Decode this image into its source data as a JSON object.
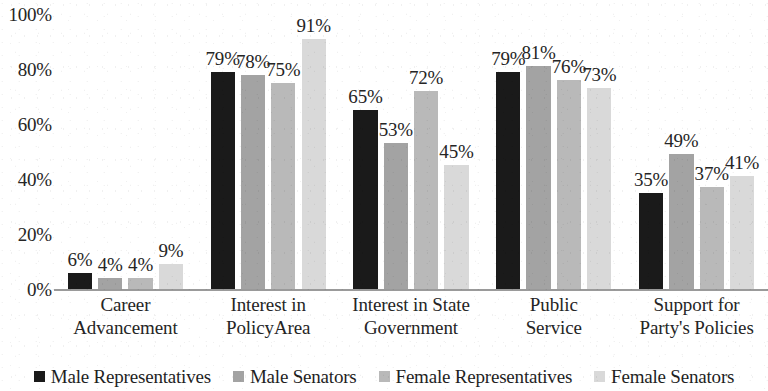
{
  "chart_data": {
    "type": "bar",
    "title": "",
    "subtitle": "",
    "xlabel": "",
    "ylabel": "",
    "ylim": [
      0,
      100
    ],
    "grid": false,
    "legend_position": "bottom",
    "y_ticks": [
      "0%",
      "20%",
      "40%",
      "60%",
      "80%",
      "100%"
    ],
    "y_tick_values": [
      0,
      20,
      40,
      60,
      80,
      100
    ],
    "categories": [
      "Career Advancement",
      "Interest in PolicyArea",
      "Interest in State Government",
      "Public Service",
      "Support for Party's Policies"
    ],
    "category_lines": [
      [
        "Career",
        "Advancement"
      ],
      [
        "Interest in",
        "PolicyArea"
      ],
      [
        "Interest in State",
        "Government"
      ],
      [
        "Public",
        "Service"
      ],
      [
        "Support for",
        "Party's Policies"
      ]
    ],
    "series": [
      {
        "name": "Male Representatives",
        "color": "#1a1a1a",
        "values": [
          6,
          79,
          65,
          79,
          35
        ],
        "labels": [
          "6%",
          "79%",
          "65%",
          "79%",
          "35%"
        ]
      },
      {
        "name": "Male Senators",
        "color": "#a3a3a3",
        "values": [
          4,
          78,
          53,
          81,
          49
        ],
        "labels": [
          "4%",
          "78%",
          "53%",
          "81%",
          "49%"
        ]
      },
      {
        "name": "Female Representatives",
        "color": "#b9b9b9",
        "values": [
          4,
          75,
          72,
          76,
          37
        ],
        "labels": [
          "4%",
          "75%",
          "72%",
          "76%",
          "37%"
        ]
      },
      {
        "name": "Female Senators",
        "color": "#d9d9d9",
        "values": [
          9,
          91,
          45,
          73,
          41
        ],
        "labels": [
          "9%",
          "91%",
          "45%",
          "73%",
          "41%"
        ]
      }
    ]
  }
}
